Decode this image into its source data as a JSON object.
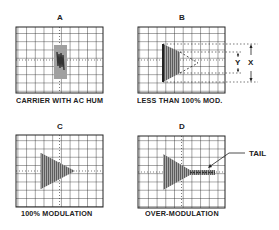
{
  "figure": {
    "panels": [
      {
        "letter": "A",
        "caption": "CARRIER WITH AC HUM"
      },
      {
        "letter": "B",
        "caption": "LESS THAN 100% MOD."
      },
      {
        "letter": "C",
        "caption": "100% MODULATION"
      },
      {
        "letter": "D",
        "caption": "OVER-MODULATION"
      }
    ],
    "annotations": {
      "x_label": "X",
      "y_label": "Y",
      "tail_label": "TAIL"
    },
    "grid": {
      "columns": 10,
      "rows": 8
    },
    "colors": {
      "ink": "#222222",
      "fill_gray": "#9a9a9a",
      "fill_dark": "#555555"
    }
  }
}
